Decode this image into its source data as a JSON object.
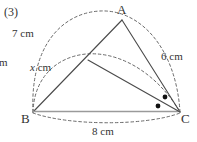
{
  "item": {
    "number": "(3)"
  },
  "clipped_text": {
    "left_fragment": "m"
  },
  "figure": {
    "vertices": {
      "a": "A",
      "b": "B",
      "c": "C"
    },
    "measures": {
      "ab": "7 cm",
      "bd": "x cm",
      "bd_variable": "x",
      "bd_unit": " cm",
      "ac": "6 cm",
      "bc": "8 cm"
    },
    "angle_marks": {
      "count": 2,
      "description": "equal-angle dots at vertex C"
    },
    "colors": {
      "stroke": "#4a4a4a",
      "baseline_stroke": "#9a9a9a",
      "dashed_stroke": "#6a6a6a",
      "dot_fill": "#111111",
      "text": "#333333",
      "background": "#ffffff"
    },
    "geometry": {
      "a": [
        122,
        20
      ],
      "b": [
        33,
        112
      ],
      "c": [
        180,
        112
      ],
      "d": [
        88,
        60
      ]
    }
  }
}
